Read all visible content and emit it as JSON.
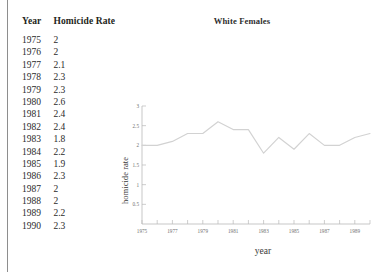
{
  "page": {
    "background_color": "#ffffff",
    "rule_color": "#8e8e8e"
  },
  "table": {
    "headers": [
      "Year",
      "Homicide Rate"
    ],
    "rows": [
      [
        "1975",
        "2"
      ],
      [
        "1976",
        "2"
      ],
      [
        "1977",
        "2.1"
      ],
      [
        "1978",
        "2.3"
      ],
      [
        "1979",
        "2.3"
      ],
      [
        "1980",
        "2.6"
      ],
      [
        "1981",
        "2.4"
      ],
      [
        "1982",
        "2.4"
      ],
      [
        "1983",
        "1.8"
      ],
      [
        "1984",
        "2.2"
      ],
      [
        "1985",
        "1.9"
      ],
      [
        "1986",
        "2.3"
      ],
      [
        "1987",
        "2"
      ],
      [
        "1988",
        "2"
      ],
      [
        "1989",
        "2.2"
      ],
      [
        "1990",
        "2.3"
      ]
    ]
  },
  "chart_data": {
    "type": "line",
    "title": "White Females",
    "xlabel": "year",
    "ylabel": "homicide rate",
    "x": [
      1975,
      1976,
      1977,
      1978,
      1979,
      1980,
      1981,
      1982,
      1983,
      1984,
      1985,
      1986,
      1987,
      1988,
      1989,
      1990
    ],
    "values": [
      2,
      2,
      2.1,
      2.3,
      2.3,
      2.6,
      2.4,
      2.4,
      1.8,
      2.2,
      1.9,
      2.3,
      2,
      2,
      2.2,
      2.3
    ],
    "series": [
      {
        "name": "White Females",
        "color": "#d2d2d2",
        "values": [
          2,
          2,
          2.1,
          2.3,
          2.3,
          2.6,
          2.4,
          2.4,
          1.8,
          2.2,
          1.9,
          2.3,
          2,
          2,
          2.2,
          2.3
        ]
      }
    ],
    "xlim": [
      1975,
      1990
    ],
    "ylim": [
      0,
      3
    ],
    "yticks": [
      0.5,
      1,
      1.5,
      2,
      2.5,
      3
    ],
    "ytick_labels": [
      "0.5",
      "1",
      "1.5",
      "2",
      "2.5",
      "3"
    ],
    "xticks": [
      1975,
      1976,
      1977,
      1978,
      1979,
      1980,
      1981,
      1982,
      1983,
      1984,
      1985,
      1986,
      1987,
      1988,
      1989,
      1990
    ],
    "xtick_labels_shown": [
      "1975",
      "1977",
      "1979",
      "1981",
      "1983",
      "1985",
      "1987",
      "1989"
    ],
    "grid": false,
    "legend": "none",
    "axis_color": "#b9b9b9",
    "tick_label_color": "#6f6f6f"
  }
}
